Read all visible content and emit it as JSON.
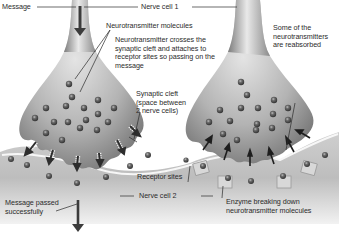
{
  "diagram": {
    "labels": {
      "message": "Message",
      "nerve_cell_1": "Nerve cell 1",
      "neurotransmitter_molecules": "Neurotransmitter molecules",
      "crosses_line1": "Neurotransmitter crosses the",
      "crosses_line2": "synaptic cleft and attaches to",
      "crosses_line3": "receptor sites so passing on the",
      "crosses_line4": "message",
      "cleft_line1": "Synaptic cleft",
      "cleft_line2": "(space between",
      "cleft_line3": "2 nerve cells)",
      "reabsorbed_line1": "Some of the",
      "reabsorbed_line2": "neurotransmitters",
      "reabsorbed_line3": "are reabsorbed",
      "receptor_sites": "Receptor sites",
      "nerve_cell_2": "Nerve cell 2",
      "passed_line1": "Message passed",
      "passed_line2": "successfully",
      "enzyme_line1": "Enzyme breaking down",
      "enzyme_line2": "neurotransmitter molecules"
    },
    "panels": [
      {
        "name": "left",
        "description": "Neurotransmitters released and crossing the cleft"
      },
      {
        "name": "right",
        "description": "Neurotransmitters reabsorbed; enzymes break down molecules"
      }
    ],
    "colors": {
      "cell_light": "#e6e6e6",
      "cell_mid": "#a9a9a9",
      "cell_dark": "#6e6e6e",
      "molecule": "#4a4a4a",
      "arrow": "#3c3c3c",
      "text": "#2b2b2b"
    }
  }
}
